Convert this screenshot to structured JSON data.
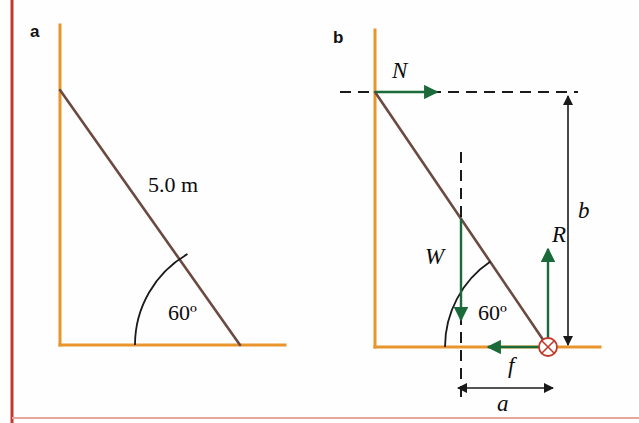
{
  "figure": {
    "width": 639,
    "height": 423,
    "background": "#fefefe",
    "border_color": "#c0392b"
  },
  "colors": {
    "wall_ground": "#e8952e",
    "ladder": "#6b4a42",
    "force_vector": "#1b6b3a",
    "dimension_line": "#1a1a1a",
    "pivot_marker": "#c0392b",
    "text": "#0d0d0d",
    "page_rule": "#c0392b"
  },
  "panels": [
    {
      "id": "a",
      "label": "a",
      "label_pos": {
        "x": 30,
        "y": 22
      },
      "geometry": {
        "wall": {
          "x": 60,
          "y_top": 25,
          "y_bottom": 345
        },
        "ground": {
          "y": 345,
          "x_left": 60,
          "x_right": 285
        },
        "ladder": {
          "x1": 60,
          "y1": 90,
          "x2": 240,
          "y2": 345
        }
      },
      "annotations": [
        {
          "name": "ladder-length-label",
          "text": "5.0 m",
          "x": 148,
          "y": 172
        },
        {
          "name": "angle-label",
          "text": "60º",
          "x": 168,
          "y": 300
        }
      ],
      "angle_arc": {
        "vertex_x": 240,
        "vertex_y": 345,
        "radius": 105,
        "from_deg": 180,
        "to_deg": 120,
        "value": 60
      }
    },
    {
      "id": "b",
      "label": "b",
      "label_pos": {
        "x": 333,
        "y": 28
      },
      "geometry": {
        "wall": {
          "x": 375,
          "y_top": 30,
          "y_bottom": 347
        },
        "ground": {
          "y": 347,
          "x_left": 375,
          "x_right": 600
        },
        "ladder": {
          "x1": 375,
          "y1": 92,
          "x2": 548,
          "y2": 347
        },
        "midpoint": {
          "x": 461,
          "y": 219
        }
      },
      "dashed_lines": [
        {
          "name": "top-horizontal-dashed-line",
          "x1": 340,
          "y1": 92,
          "x2": 578,
          "y2": 92
        },
        {
          "name": "center-of-gravity-vertical-dashed-line",
          "x1": 461,
          "y1": 152,
          "x2": 461,
          "y2": 400
        }
      ],
      "force_vectors": [
        {
          "name": "normal-force-vector",
          "symbol": "N",
          "direction": "right",
          "x1": 375,
          "y1": 92,
          "x2": 437,
          "y2": 92,
          "label_x": 392,
          "label_y": 58
        },
        {
          "name": "weight-force-vector",
          "symbol": "W",
          "direction": "down",
          "x1": 461,
          "y1": 219,
          "x2": 461,
          "y2": 320,
          "label_x": 425,
          "label_y": 244
        },
        {
          "name": "reaction-force-vector",
          "symbol": "R",
          "direction": "up",
          "x1": 548,
          "y1": 347,
          "x2": 548,
          "y2": 249,
          "label_x": 552,
          "label_y": 222
        },
        {
          "name": "friction-force-vector",
          "symbol": "f",
          "direction": "left",
          "x1": 548,
          "y1": 347,
          "x2": 488,
          "y2": 347,
          "label_x": 508,
          "label_y": 353
        }
      ],
      "dimension_lines": [
        {
          "name": "height-dimension-b",
          "symbol": "b",
          "orientation": "vertical",
          "x1": 568,
          "y1": 96,
          "x2": 568,
          "y2": 345,
          "label_x": 578,
          "label_y": 198
        },
        {
          "name": "base-dimension-a",
          "symbol": "a",
          "orientation": "horizontal",
          "x1": 458,
          "y1": 388,
          "x2": 553,
          "y2": 388,
          "label_x": 497,
          "label_y": 391
        }
      ],
      "pivot_marker": {
        "name": "pivot-point-marker",
        "cx": 548,
        "cy": 347,
        "r": 9
      },
      "annotations": [
        {
          "name": "angle-label",
          "text": "60º",
          "x": 478,
          "y": 300
        }
      ],
      "angle_arc": {
        "vertex_x": 548,
        "vertex_y": 347,
        "radius": 103,
        "from_deg": 180,
        "to_deg": 124,
        "value": 60
      }
    }
  ],
  "page_rules": {
    "left_vertical": {
      "x": 12,
      "y_top": 0,
      "y_bottom": 423
    },
    "bottom_horizontal": {
      "y": 418,
      "x_left": 12,
      "x_right": 639
    }
  }
}
